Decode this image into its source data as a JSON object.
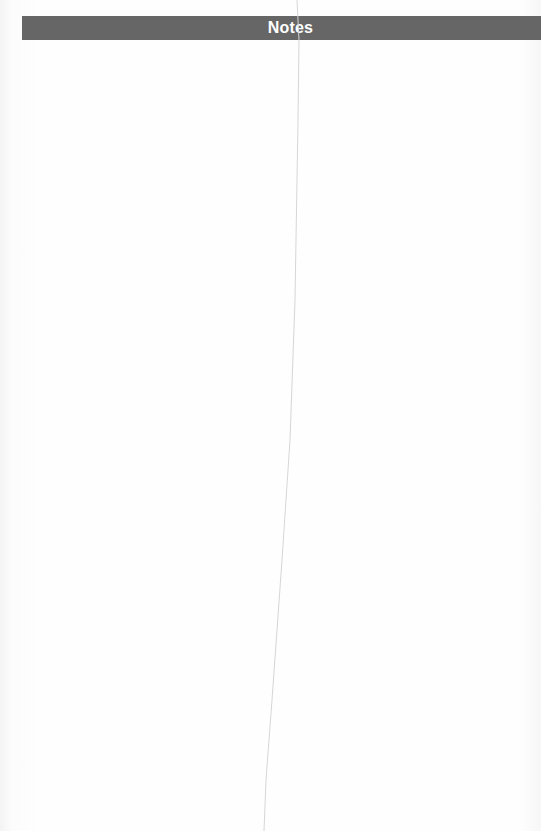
{
  "header": {
    "title": "Notes",
    "background_color": "#666666",
    "text_color": "#ffffff"
  },
  "page": {
    "background_color": "#fdfdfd",
    "body_text": ""
  }
}
